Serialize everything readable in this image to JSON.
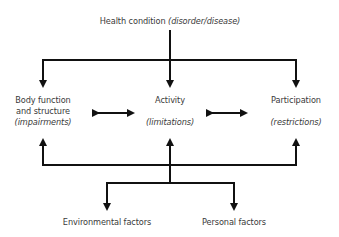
{
  "diagram": {
    "type": "ICF framework",
    "stroke_color": "#111111",
    "text_color": "#3a3a3a",
    "top": {
      "label": "Health condition",
      "qualifier": "(disorder/disease)"
    },
    "components": [
      {
        "id": "body",
        "line1": "Body function",
        "line2": "and structure",
        "qualifier": "(impairments)"
      },
      {
        "id": "activity",
        "line1": "Activity",
        "qualifier": "(limitations)"
      },
      {
        "id": "participation",
        "line1": "Participation",
        "qualifier": "(restrictions)"
      }
    ],
    "contextual_factors": [
      {
        "id": "environmental",
        "label": "Environmental factors"
      },
      {
        "id": "personal",
        "label": "Personal factors"
      }
    ],
    "connections": [
      {
        "from": "health-condition",
        "to": "body",
        "type": "arrow"
      },
      {
        "from": "health-condition",
        "to": "activity",
        "type": "arrow"
      },
      {
        "from": "health-condition",
        "to": "participation",
        "type": "arrow"
      },
      {
        "from": "body",
        "to": "activity",
        "type": "bidirectional"
      },
      {
        "from": "activity",
        "to": "participation",
        "type": "bidirectional"
      },
      {
        "from": "contextual-bus",
        "to": "body",
        "type": "arrow"
      },
      {
        "from": "contextual-bus",
        "to": "activity",
        "type": "arrow"
      },
      {
        "from": "contextual-bus",
        "to": "participation",
        "type": "arrow"
      },
      {
        "from": "contextual-bus",
        "to": "environmental",
        "type": "arrow"
      },
      {
        "from": "contextual-bus",
        "to": "personal",
        "type": "arrow"
      }
    ]
  }
}
